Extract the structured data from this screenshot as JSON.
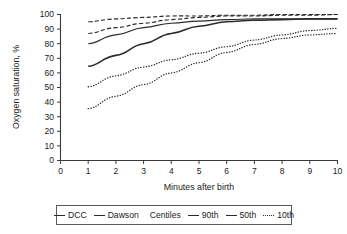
{
  "chart_data": {
    "type": "line",
    "title": "",
    "xlabel": "Minutes after birth",
    "ylabel": "Oxygen saturation, %",
    "xlim": [
      0,
      10
    ],
    "ylim": [
      0,
      100
    ],
    "xticks": [
      0,
      1,
      2,
      3,
      4,
      5,
      6,
      7,
      8,
      9,
      10
    ],
    "yticks": [
      0,
      10,
      20,
      30,
      40,
      50,
      60,
      70,
      80,
      90,
      100
    ],
    "grid": false,
    "legend_position": "below-center",
    "x": [
      1,
      2,
      3,
      4,
      5,
      6,
      7,
      8,
      9,
      10
    ],
    "series": [
      {
        "name": "DCC 90th",
        "style": "dashed",
        "values": [
          95,
          97,
          98,
          99,
          99,
          99.5,
          99.5,
          100,
          100,
          100
        ]
      },
      {
        "name": "DCC 50th",
        "style": "dashed",
        "values": [
          87,
          91,
          94,
          96.5,
          98,
          99,
          99,
          99.5,
          99.5,
          100
        ]
      },
      {
        "name": "Dawson 90th",
        "style": "solid-thin",
        "values": [
          80,
          86,
          91,
          94,
          95.5,
          96.5,
          97,
          97,
          97,
          97
        ]
      },
      {
        "name": "Dawson 50th",
        "style": "solid-thick",
        "values": [
          64.5,
          72,
          80,
          87,
          92,
          95,
          96,
          96.5,
          97,
          97
        ]
      },
      {
        "name": "DCC 10th",
        "style": "dotted",
        "values": [
          50.5,
          58,
          64,
          69,
          73.5,
          78,
          82.5,
          86,
          89,
          90.5
        ]
      },
      {
        "name": "Dawson 10th",
        "style": "dotted",
        "values": [
          35.5,
          44,
          52,
          60,
          67,
          74,
          79.5,
          83.5,
          86,
          87
        ]
      }
    ],
    "legend": [
      {
        "label": "DCC",
        "marker": "solid-thin"
      },
      {
        "label": "Dawson",
        "marker": "solid-thick"
      },
      {
        "label": "Centiles",
        "marker": "none"
      },
      {
        "label": "90th",
        "marker": "solid-thin"
      },
      {
        "label": "50th",
        "marker": "solid-thick"
      },
      {
        "label": "10th",
        "marker": "dotted"
      }
    ]
  },
  "axes": {
    "ylabel": "Oxygen saturation, %",
    "xlabel": "Minutes after birth",
    "yticklabels": [
      "0",
      "10",
      "20",
      "30",
      "40",
      "50",
      "60",
      "70",
      "80",
      "90",
      "100"
    ],
    "xticklabels": [
      "0",
      "1",
      "2",
      "3",
      "4",
      "5",
      "6",
      "7",
      "8",
      "9",
      "10"
    ]
  },
  "legend": {
    "dcc": "DCC",
    "dawson": "Dawson",
    "centiles": "Centiles",
    "p90": "90th",
    "p50": "50th",
    "p10": "10th"
  },
  "colors": {
    "ink": "#2b2b2b",
    "axis": "#3a3a3a",
    "background": "#ffffff",
    "legend_border": "#5a5a5a"
  }
}
